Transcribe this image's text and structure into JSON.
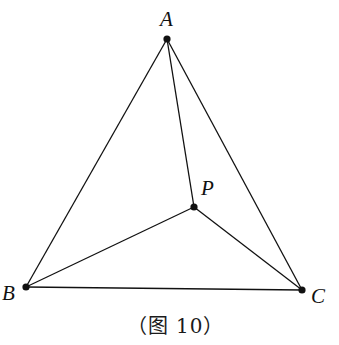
{
  "figure": {
    "caption": "（图 10）",
    "stroke_color": "#111111",
    "points": {
      "A": {
        "label": "A",
        "x": 167,
        "y": 39
      },
      "B": {
        "label": "B",
        "x": 26,
        "y": 287
      },
      "C": {
        "label": "C",
        "x": 302,
        "y": 290
      },
      "P": {
        "label": "P",
        "x": 194,
        "y": 207
      }
    },
    "segments": [
      [
        "A",
        "B"
      ],
      [
        "A",
        "C"
      ],
      [
        "B",
        "C"
      ],
      [
        "A",
        "P"
      ],
      [
        "B",
        "P"
      ],
      [
        "C",
        "P"
      ]
    ]
  }
}
